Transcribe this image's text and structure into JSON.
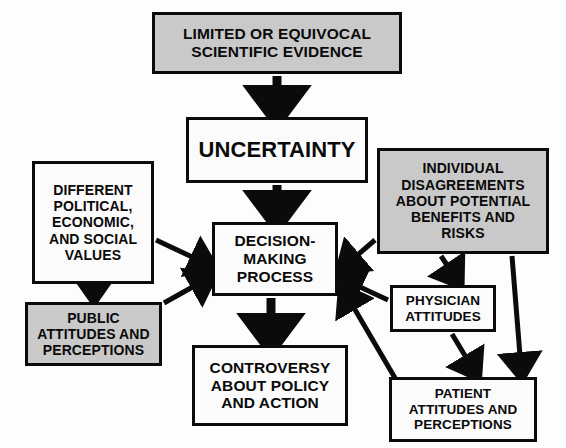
{
  "diagram": {
    "canvas": {
      "width": 566,
      "height": 448,
      "background": "#fdfdfd"
    },
    "colors": {
      "gray_fill": "#c9c9c9",
      "white_fill": "#fbfbfb",
      "stroke": "#0b0b0b",
      "text": "#0a0a0a"
    },
    "nodes": [
      {
        "id": "evidence",
        "text": "LIMITED OR EQUIVOCAL\nSCIENTIFIC EVIDENCE",
        "fill": "gray"
      },
      {
        "id": "uncertainty",
        "text": "UNCERTAINTY",
        "fill": "white"
      },
      {
        "id": "values",
        "text": "DIFFERENT\nPOLITICAL,\nECONOMIC,\nAND SOCIAL\nVALUES",
        "fill": "white"
      },
      {
        "id": "individual",
        "text": "INDIVIDUAL\nDISAGREEMENTS\nABOUT POTENTIAL\nBENEFITS AND\nRISKS",
        "fill": "gray"
      },
      {
        "id": "decision",
        "text": "DECISION-\nMAKING\nPROCESS",
        "fill": "white"
      },
      {
        "id": "public",
        "text": "PUBLIC\nATTITUDES AND\nPERCEPTIONS",
        "fill": "gray"
      },
      {
        "id": "physician",
        "text": "PHYSICIAN\nATTITUDES",
        "fill": "white"
      },
      {
        "id": "controversy",
        "text": "CONTROVERSY\nABOUT POLICY\nAND ACTION",
        "fill": "white"
      },
      {
        "id": "patient",
        "text": "PATIENT\nATTITUDES AND\nPERCEPTIONS",
        "fill": "white"
      }
    ],
    "edges": [
      {
        "from": "evidence",
        "to": "uncertainty",
        "style": "thick-vertical"
      },
      {
        "from": "uncertainty",
        "to": "decision",
        "style": "thick-vertical"
      },
      {
        "from": "values",
        "to": "decision",
        "style": "diagonal"
      },
      {
        "from": "values",
        "to": "public",
        "style": "thin-vertical"
      },
      {
        "from": "public",
        "to": "decision",
        "style": "diagonal"
      },
      {
        "from": "individual",
        "to": "decision",
        "style": "diagonal"
      },
      {
        "from": "individual",
        "to": "physician",
        "style": "diagonal"
      },
      {
        "from": "individual",
        "to": "patient",
        "style": "diagonal"
      },
      {
        "from": "physician",
        "to": "decision",
        "style": "diagonal"
      },
      {
        "from": "physician",
        "to": "patient",
        "style": "diagonal"
      },
      {
        "from": "patient",
        "to": "decision",
        "style": "diagonal"
      },
      {
        "from": "decision",
        "to": "controversy",
        "style": "thick-vertical"
      }
    ]
  }
}
